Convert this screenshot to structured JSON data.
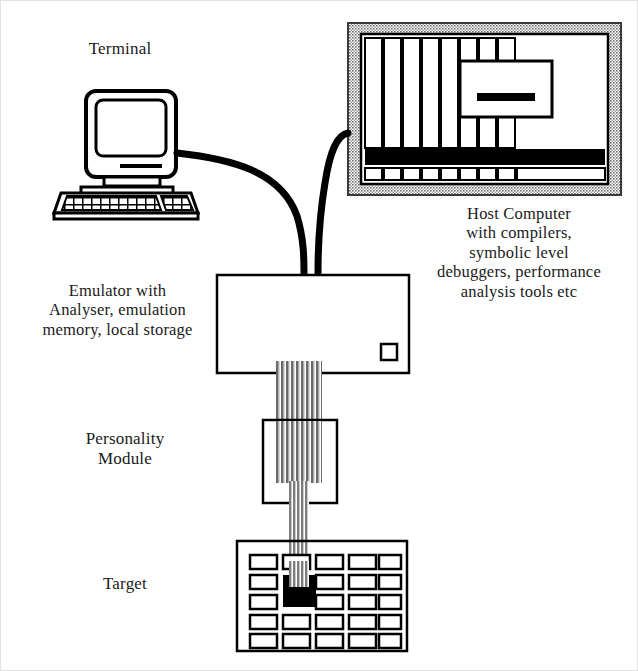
{
  "diagram": {
    "background_color": "#ffffff",
    "ink_color": "#000000",
    "cabinet_frame_color": "#8c8c8c",
    "ribbon_color": "#9a9a9a"
  },
  "labels": {
    "terminal": "Terminal",
    "host": "Host Computer\nwith compilers,\nsymbolic level\ndebuggers, performance\nanalysis tools etc",
    "emulator": "Emulator with\nAnalyser, emulation\nmemory, local storage",
    "personality": "Personality\nModule",
    "target": "Target"
  },
  "nodes": {
    "terminal": {
      "name": "Terminal",
      "kind": "desktop-workstation",
      "parts": [
        "monitor-body",
        "screen",
        "disk-slot",
        "keyboard",
        "keypad"
      ]
    },
    "host_computer": {
      "name": "Host Computer",
      "kind": "rack-cabinet",
      "card_slots": 8,
      "parts": [
        "cabinet-frame",
        "card-cage",
        "black-bar",
        "bottom-tabs",
        "panel-window",
        "panel-bar"
      ]
    },
    "emulator": {
      "name": "Emulator",
      "kind": "rectangular-box",
      "parts": [
        "body",
        "indicator-square"
      ]
    },
    "personality_module": {
      "name": "Personality Module",
      "kind": "square-box"
    },
    "target": {
      "name": "Target",
      "kind": "pcb-board",
      "chip_rows": 5,
      "chip_columns": 5,
      "socketed_chip": {
        "row": 2,
        "column": 2,
        "filled": true
      }
    }
  },
  "connections": [
    {
      "name": "terminal-to-emulator",
      "kind": "thick-curved-cable",
      "from": "terminal",
      "to": "emulator"
    },
    {
      "name": "host-to-emulator",
      "kind": "thick-curved-cable",
      "from": "host_computer",
      "to": "emulator"
    },
    {
      "name": "emulator-to-personality",
      "kind": "wide-ribbon-cable",
      "from": "emulator",
      "to": "personality_module",
      "conductors": 16
    },
    {
      "name": "personality-to-target",
      "kind": "narrow-ribbon-cable",
      "from": "personality_module",
      "to": "target",
      "conductors": 6
    }
  ]
}
